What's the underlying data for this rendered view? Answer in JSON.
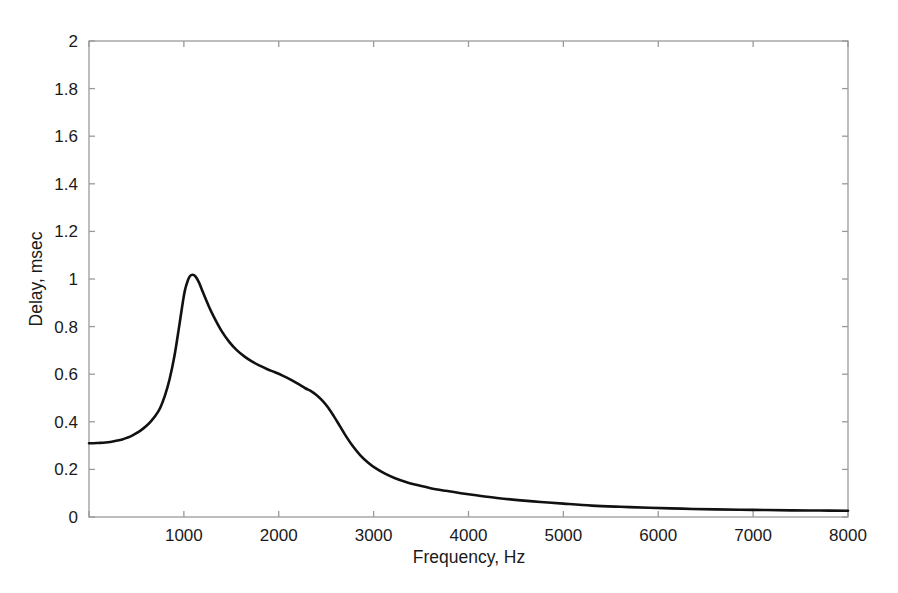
{
  "figure": {
    "background_color": "#ffffff",
    "axes_color": "#9a9a9a",
    "curve_color": "#111111",
    "text_color": "#1a1a1a"
  },
  "chart_data": {
    "type": "line",
    "title": "",
    "subtitle": "",
    "xlabel": "Frequency, Hz",
    "ylabel": "Delay, msec",
    "xlim": [
      0,
      8000
    ],
    "ylim": [
      0,
      2
    ],
    "grid": false,
    "legend": null,
    "legend_position": "none",
    "box": true,
    "tick_direction": "in",
    "xticks": [
      0,
      1000,
      2000,
      3000,
      4000,
      5000,
      6000,
      7000,
      8000
    ],
    "xtick_labels": [
      "",
      "1000",
      "2000",
      "3000",
      "4000",
      "5000",
      "6000",
      "7000",
      "8000"
    ],
    "yticks": [
      0,
      0.2,
      0.4,
      0.6,
      0.8,
      1,
      1.2,
      1.4,
      1.6,
      1.8,
      2
    ],
    "ytick_labels": [
      "0",
      "0.2",
      "0.4",
      "0.6",
      "0.8",
      "1",
      "1.2",
      "1.4",
      "1.6",
      "1.8",
      "2"
    ],
    "series": [
      {
        "name": "Group delay",
        "line_width": 2.6,
        "color": "#111111",
        "x": [
          0,
          50,
          100,
          150,
          200,
          250,
          300,
          350,
          400,
          450,
          500,
          550,
          600,
          650,
          700,
          750,
          800,
          850,
          900,
          950,
          1000,
          1030,
          1060,
          1090,
          1120,
          1160,
          1200,
          1260,
          1320,
          1400,
          1480,
          1560,
          1640,
          1720,
          1800,
          1880,
          1960,
          2040,
          2120,
          2200,
          2280,
          2340,
          2400,
          2460,
          2520,
          2580,
          2640,
          2700,
          2780,
          2860,
          2940,
          3020,
          3120,
          3220,
          3340,
          3460,
          3600,
          3760,
          3920,
          4100,
          4300,
          4520,
          4760,
          5000,
          5300,
          5600,
          5900,
          6250,
          6600,
          7000,
          7400,
          7700,
          8000
        ],
        "y": [
          0.31,
          0.31,
          0.311,
          0.312,
          0.314,
          0.317,
          0.321,
          0.326,
          0.333,
          0.341,
          0.352,
          0.365,
          0.381,
          0.401,
          0.425,
          0.458,
          0.51,
          0.58,
          0.675,
          0.8,
          0.93,
          0.98,
          1.01,
          1.018,
          1.012,
          0.985,
          0.945,
          0.888,
          0.838,
          0.78,
          0.735,
          0.7,
          0.674,
          0.653,
          0.636,
          0.621,
          0.608,
          0.594,
          0.578,
          0.56,
          0.541,
          0.529,
          0.512,
          0.489,
          0.46,
          0.424,
          0.385,
          0.345,
          0.298,
          0.259,
          0.229,
          0.205,
          0.182,
          0.164,
          0.147,
          0.134,
          0.121,
          0.11,
          0.1,
          0.09,
          0.08,
          0.071,
          0.063,
          0.056,
          0.048,
          0.043,
          0.039,
          0.035,
          0.032,
          0.03,
          0.028,
          0.027,
          0.026
        ]
      }
    ],
    "annotations": [
      {
        "label": "peak",
        "x": 1080,
        "y": 1.02
      },
      {
        "label": "shoulder",
        "x": 2260,
        "y": 0.53
      },
      {
        "label": "low-frequency-plateau",
        "x": 120,
        "y": 0.31
      },
      {
        "label": "high-frequency-tail",
        "x": 8000,
        "y": 0.026
      }
    ]
  }
}
